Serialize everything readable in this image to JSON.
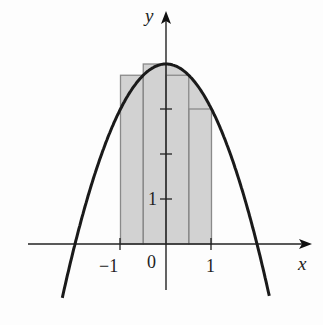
{
  "figure": {
    "type": "riemann-sum-diagram",
    "function": "y = 4 - x^2",
    "axes": {
      "x_label": "x",
      "y_label": "y",
      "x_tick_labels": [
        "-1",
        "0",
        "1"
      ],
      "y_tick_labels": [
        "1"
      ]
    },
    "rectangles": [
      {
        "x_left": -1.0,
        "x_right": -0.5,
        "height": 3.75
      },
      {
        "x_left": -0.5,
        "x_right": 0.0,
        "height": 4.0
      },
      {
        "x_left": 0.0,
        "x_right": 0.5,
        "height": 3.75
      },
      {
        "x_left": 0.5,
        "x_right": 1.0,
        "height": 3.0
      }
    ],
    "colors": {
      "curve": "#1a1a1a",
      "axis": "#222222",
      "rect_fill": "#d2d2d2",
      "rect_stroke": "#8a8a8a"
    }
  },
  "labels": {
    "x_axis": "x",
    "y_axis": "y",
    "x_neg1": "−1",
    "x_zero": "0",
    "x_pos1": "1",
    "y_one": "1"
  }
}
